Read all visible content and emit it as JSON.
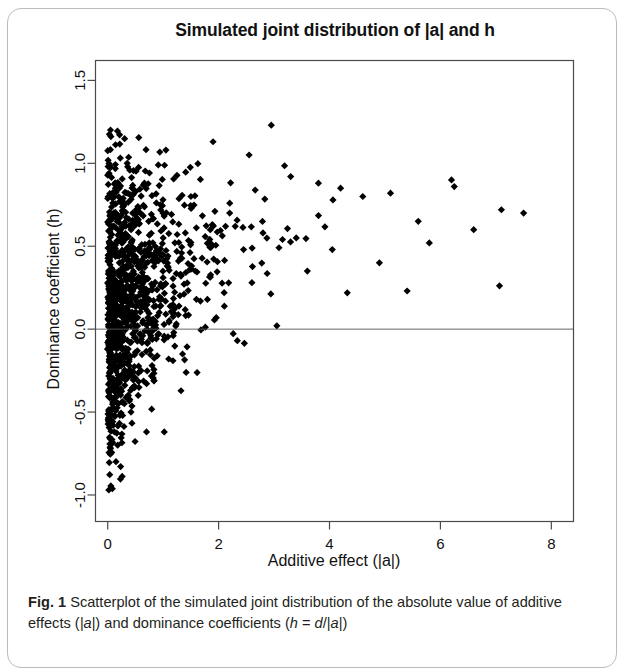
{
  "figure": {
    "label": "Fig. 1",
    "title": "Simulated joint distribution of |a| and h",
    "caption_part1": "Scatterplot of the simulated joint distribution of the absolute",
    "caption_part2_a": "value of additive effects (",
    "caption_part2_b": "|a|",
    "caption_part2_c": ") and dominance coefficients (",
    "caption_part2_d": "h",
    "caption_part2_e": " = ",
    "caption_part2_f": "d",
    "caption_part2_g": "/|",
    "caption_part2_h": "a",
    "caption_part2_i": "|)"
  },
  "chart_data": {
    "type": "scatter",
    "title": "Simulated joint distribution of |a| and h",
    "xlabel": "Additive effect (|a|)",
    "ylabel": "Dominance coefficient (h)",
    "xlim": [
      -0.22,
      8.4
    ],
    "ylim": [
      -1.16,
      1.62
    ],
    "xticks": [
      0,
      2,
      4,
      6,
      8
    ],
    "xtick_labels": [
      "0",
      "2",
      "4",
      "6",
      "8"
    ],
    "yticks": [
      -1.0,
      -0.5,
      0.0,
      0.5,
      1.0,
      1.5
    ],
    "ytick_labels": [
      "-1.0",
      "-0.5",
      "0.0",
      "0.5",
      "1.0",
      "1.5"
    ],
    "grid": false,
    "legend": null,
    "point_color": "#000000",
    "point_marker": "diamond",
    "point_size": 3.6,
    "n_points": 1100,
    "reference_lines": [
      {
        "orientation": "horizontal",
        "y": 0.0,
        "color": "#555555",
        "width": 0.9
      }
    ],
    "distribution_note": {
      "x_distribution": "gamma-like, heavily right-skewed, mode near 0, max approx 7.5",
      "y_distribution": "normal-like conditional on x, mean increases with x, variance decreases with x",
      "y_min": -0.97,
      "y_max": 1.23,
      "x_min": 0.01,
      "x_max": 7.5
    },
    "sample_points": [
      [
        0.02,
        -0.97
      ],
      [
        0.05,
        -0.72
      ],
      [
        0.08,
        -0.68
      ],
      [
        0.12,
        -0.62
      ],
      [
        0.18,
        -0.7
      ],
      [
        0.7,
        -0.62
      ],
      [
        1.02,
        -0.62
      ],
      [
        0.06,
        -0.55
      ],
      [
        0.1,
        -0.48
      ],
      [
        0.22,
        -0.52
      ],
      [
        0.3,
        -0.45
      ],
      [
        0.42,
        -0.5
      ],
      [
        0.55,
        -0.4
      ],
      [
        0.15,
        -0.35
      ],
      [
        0.25,
        -0.3
      ],
      [
        0.4,
        -0.28
      ],
      [
        0.6,
        -0.25
      ],
      [
        0.8,
        -0.22
      ],
      [
        1.1,
        -0.18
      ],
      [
        1.35,
        -0.15
      ],
      [
        0.03,
        -0.2
      ],
      [
        0.07,
        -0.12
      ],
      [
        0.14,
        -0.08
      ],
      [
        0.28,
        -0.05
      ],
      [
        0.5,
        0.02
      ],
      [
        0.9,
        0.08
      ],
      [
        1.2,
        0.12
      ],
      [
        1.6,
        0.18
      ],
      [
        2.1,
        0.22
      ],
      [
        2.6,
        0.28
      ],
      [
        0.05,
        0.15
      ],
      [
        0.12,
        0.25
      ],
      [
        0.2,
        0.35
      ],
      [
        0.35,
        0.42
      ],
      [
        0.55,
        0.48
      ],
      [
        0.75,
        0.52
      ],
      [
        1.0,
        0.55
      ],
      [
        1.4,
        0.58
      ],
      [
        1.85,
        0.6
      ],
      [
        2.3,
        0.62
      ],
      [
        0.08,
        0.62
      ],
      [
        0.18,
        0.68
      ],
      [
        0.45,
        0.7
      ],
      [
        0.95,
        0.75
      ],
      [
        1.5,
        0.8
      ],
      [
        1.9,
        1.13
      ],
      [
        2.95,
        1.23
      ],
      [
        2.55,
        1.05
      ],
      [
        1.05,
        1.08
      ],
      [
        3.3,
        0.92
      ],
      [
        3.8,
        0.88
      ],
      [
        4.2,
        0.85
      ],
      [
        4.6,
        0.8
      ],
      [
        5.1,
        0.82
      ],
      [
        5.6,
        0.65
      ],
      [
        6.2,
        0.9
      ],
      [
        6.25,
        0.86
      ],
      [
        7.1,
        0.72
      ],
      [
        7.5,
        0.7
      ],
      [
        5.8,
        0.52
      ],
      [
        4.9,
        0.4
      ],
      [
        5.4,
        0.23
      ],
      [
        3.05,
        0.02
      ],
      [
        3.6,
        0.35
      ],
      [
        4.05,
        0.48
      ],
      [
        2.8,
        0.58
      ],
      [
        3.4,
        0.55
      ],
      [
        2.2,
        0.7
      ],
      [
        2.45,
        0.48
      ],
      [
        6.6,
        0.6
      ]
    ]
  },
  "axes": {
    "x_title": "Additive effect (|a|)",
    "y_title": "Dominance coefficient (h)"
  }
}
